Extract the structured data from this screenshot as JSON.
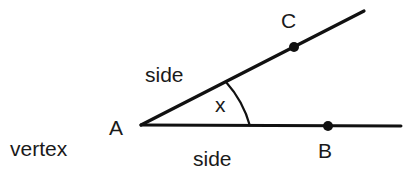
{
  "diagram": {
    "labels": {
      "vertex_point": "A",
      "point_on_lower_ray": "B",
      "point_on_upper_ray": "C",
      "angle": "x",
      "upper_side": "side",
      "lower_side": "side",
      "vertex_term": "vertex"
    },
    "colors": {
      "stroke": "#111111",
      "text": "#1a1a1a",
      "background": "#ffffff"
    }
  }
}
